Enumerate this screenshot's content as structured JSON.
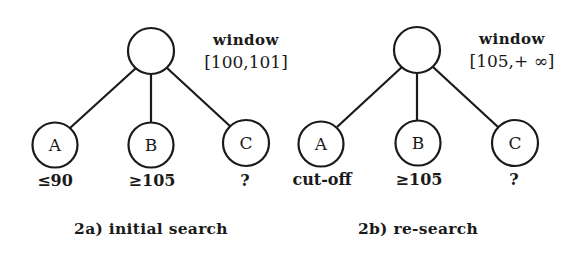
{
  "diagrams": [
    {
      "id": "2a",
      "caption": "2a) initial search",
      "window_label": "window",
      "window_range": "[100,101]",
      "root": {
        "label": ""
      },
      "children": [
        {
          "label": "A",
          "value": "≤90"
        },
        {
          "label": "B",
          "value": "≥105"
        },
        {
          "label": "C",
          "value": "?"
        }
      ]
    },
    {
      "id": "2b",
      "caption": "2b) re-search",
      "window_label": "window",
      "window_range": "[105,+ ∞]",
      "root": {
        "label": ""
      },
      "children": [
        {
          "label": "A",
          "value": "cut-off"
        },
        {
          "label": "B",
          "value": "≥105"
        },
        {
          "label": "C",
          "value": "?"
        }
      ]
    }
  ],
  "colors": {
    "stroke": "#1a1a1a",
    "background": "#ffffff"
  }
}
